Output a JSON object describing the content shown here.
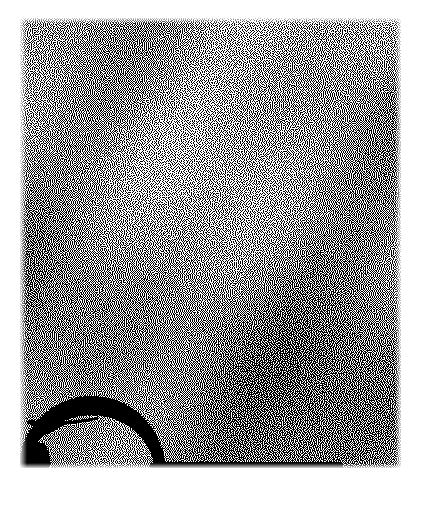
{
  "image": {
    "kind": "dithered-grayscale-scan",
    "canvas_width": 421,
    "canvas_height": 512,
    "background_color": "#ffffff",
    "ink_color": "#000000",
    "caption": "",
    "title": ""
  },
  "scan_field": {
    "name": "dithered-scan-region",
    "x": 20,
    "y": 18,
    "width": 381,
    "height": 450,
    "dither_type": "error-diffusion",
    "dot_size": 1,
    "description": "Rectangular halftone-dithered noise field occupying most of the frame"
  },
  "gradient": {
    "description": "Ink density increases from top to bottom",
    "top_density_percent": 38,
    "bottom_density_percent": 58,
    "left_edge_density_percent": 44,
    "right_edge_density_percent": 46,
    "corner_falloff_percent": 6
  },
  "features": [
    {
      "name": "dome-arc",
      "label": "dark curved arc",
      "type": "arc",
      "x": 25,
      "y": 398,
      "width": 132,
      "height": 70,
      "stroke_color": "#000000",
      "stroke_width": 7,
      "description": "Dark dome / arch shaped band rising in the lower-left quadrant and descending to the baseline"
    },
    {
      "name": "baseline-rule",
      "label": "horizontal baseline",
      "type": "line",
      "x1": 150,
      "y1": 465,
      "x2": 341,
      "y2": 465,
      "stroke_color": "#000000",
      "stroke_width": 4,
      "description": "Solid dark horizontal rule along the bottom of the scan field"
    },
    {
      "name": "corner-blob",
      "label": "dark blob",
      "type": "blob",
      "x": 22,
      "y": 444,
      "width": 22,
      "height": 19,
      "fill_color": "#000000",
      "description": "Small solid dark smudge at the lower-left of the scan field"
    },
    {
      "name": "upper-shoulder-streak",
      "label": "faint dark streak",
      "type": "streak",
      "x": 28,
      "y": 416,
      "width": 70,
      "height": 10,
      "stroke_color": "#1a1a1a",
      "description": "Faint dark sweep running left from the base of the arc"
    }
  ],
  "noise_seed": 20240517
}
